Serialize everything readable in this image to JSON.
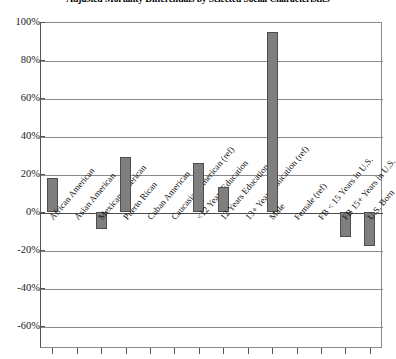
{
  "chart_data": {
    "type": "bar",
    "title": "Adjusted Mortality Differentials by Selected Social Characteristics",
    "xlabel": "",
    "ylabel": "",
    "ylim": [
      -70,
      105
    ],
    "grid": true,
    "legend": "none",
    "ytick_labels": [
      "100%",
      "80%",
      "60%",
      "40%",
      "20%",
      "0%",
      "-20%",
      "-40%",
      "-60%"
    ],
    "ytick_values": [
      100,
      80,
      60,
      40,
      20,
      0,
      -20,
      -40,
      -60
    ],
    "categories": [
      "African American",
      "Asian American",
      "Mexican American",
      "Puerto Rican",
      "Cuban American",
      "Caucasian American (ref)",
      "<12 Years Education",
      "12 Years Education",
      "13+ Years Education (ref)",
      "Male",
      "Female (ref)",
      "FB < 15 Years in U.S.",
      "FB 15+ Years in U.S.",
      "U.S. Born"
    ],
    "values": [
      18,
      0,
      -9,
      29,
      0,
      0,
      26,
      13,
      0,
      95,
      0,
      0,
      -13,
      -18
    ],
    "bar_color": "#7f7f7f",
    "bar_edge_color": "#4d4d4d"
  }
}
